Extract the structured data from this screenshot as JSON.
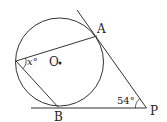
{
  "diagram": {
    "type": "geometry",
    "colors": {
      "stroke": "#333333",
      "text": "#222222",
      "background": "#ffffff"
    },
    "labels": {
      "point_a": "A",
      "point_b": "B",
      "point_p": "P",
      "center_o": "O",
      "angle_x": "x°",
      "angle_p": "54°"
    },
    "given": {
      "angle_APB_degrees": 54
    },
    "unknown": "x"
  }
}
